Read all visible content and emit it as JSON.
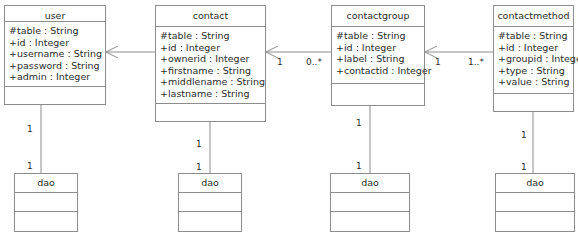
{
  "diagram": {
    "type": "uml-class-diagram",
    "classes": [
      {
        "id": "user",
        "name": "user",
        "attributes": [
          "#table : String",
          "+id : Integer",
          "+username : String",
          "+password : String",
          "+admin : Integer"
        ],
        "operations": []
      },
      {
        "id": "contact",
        "name": "contact",
        "attributes": [
          "#table : String",
          "+id : Integer",
          "+ownerid : Integer",
          "+firstname : String",
          "+middlename : String",
          "+lastname : String"
        ],
        "operations": []
      },
      {
        "id": "contactgroup",
        "name": "contactgroup",
        "attributes": [
          "#table : String",
          "+id : Integer",
          "+label : String",
          "+contactid : Integer"
        ],
        "operations": []
      },
      {
        "id": "contactmethod",
        "name": "contactmethod",
        "attributes": [
          "#table : String",
          "+id : Integer",
          "+groupid : Integer",
          "+type : String",
          "+value : String"
        ],
        "operations": []
      },
      {
        "id": "dao_user",
        "name": "dao",
        "attributes": [],
        "operations": []
      },
      {
        "id": "dao_contact",
        "name": "dao",
        "attributes": [],
        "operations": []
      },
      {
        "id": "dao_contactgroup",
        "name": "dao",
        "attributes": [],
        "operations": []
      },
      {
        "id": "dao_contactmethod",
        "name": "dao",
        "attributes": [],
        "operations": []
      }
    ],
    "associations": [
      {
        "from": "contact",
        "to": "user",
        "source_multiplicity": "",
        "target_multiplicity": "",
        "arrow": "open"
      },
      {
        "from": "contactgroup",
        "to": "contact",
        "source_multiplicity": "0..*",
        "target_multiplicity": "1",
        "arrow": "open"
      },
      {
        "from": "contactmethod",
        "to": "contactgroup",
        "source_multiplicity": "1..*",
        "target_multiplicity": "1",
        "arrow": "open"
      },
      {
        "from": "user",
        "to": "dao_user",
        "source_multiplicity": "1",
        "target_multiplicity": "1",
        "arrow": "none"
      },
      {
        "from": "contact",
        "to": "dao_contact",
        "source_multiplicity": "1",
        "target_multiplicity": "1",
        "arrow": "none"
      },
      {
        "from": "contactgroup",
        "to": "dao_contactgroup",
        "source_multiplicity": "1",
        "target_multiplicity": "1",
        "arrow": "none"
      },
      {
        "from": "contactmethod",
        "to": "dao_contactmethod",
        "source_multiplicity": "1",
        "target_multiplicity": "1",
        "arrow": "none"
      }
    ],
    "multiplicity_labels": [
      {
        "text": "1",
        "x": 277,
        "y": 57
      },
      {
        "text": "0..*",
        "x": 306,
        "y": 57
      },
      {
        "text": "1",
        "x": 435,
        "y": 57
      },
      {
        "text": "1..*",
        "x": 468,
        "y": 57
      },
      {
        "text": "1",
        "x": 27,
        "y": 124
      },
      {
        "text": "1",
        "x": 27,
        "y": 161
      },
      {
        "text": "1",
        "x": 196,
        "y": 139
      },
      {
        "text": "1",
        "x": 196,
        "y": 162
      },
      {
        "text": "1",
        "x": 356,
        "y": 118
      },
      {
        "text": "1",
        "x": 356,
        "y": 161
      },
      {
        "text": "1",
        "x": 521,
        "y": 130
      },
      {
        "text": "1",
        "x": 521,
        "y": 162
      }
    ],
    "colors": {
      "stroke": "#8c8c8c",
      "text": "#2b2b2b",
      "background": "#ffffff"
    }
  }
}
